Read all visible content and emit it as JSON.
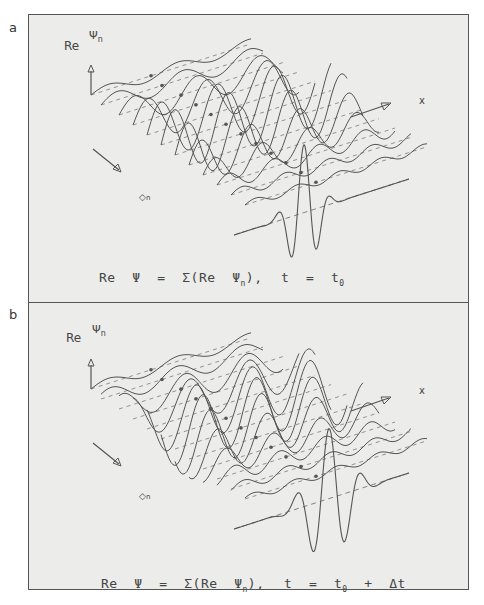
{
  "figure": {
    "panels": [
      {
        "id": "a",
        "label": "a",
        "y_axis_label": "Re",
        "y_axis_symbol": "Ψ",
        "y_axis_sub": "n",
        "n_axis_symbol": "n",
        "x_axis_symbol": "x",
        "equation_lhs": "Re  Ψ  =  Σ(Re  Ψ",
        "equation_sub": "n",
        "equation_close": "),",
        "time_text": "t  =  t",
        "time_sub": "0",
        "time_extra": "",
        "packet_shift": 0.0
      },
      {
        "id": "b",
        "label": "b",
        "y_axis_label": "Re",
        "y_axis_symbol": "Ψ",
        "y_axis_sub": "n",
        "n_axis_symbol": "n",
        "x_axis_symbol": "x",
        "equation_lhs": "Re  Ψ  =  Σ(Re  Ψ",
        "equation_sub": "n",
        "equation_close": "),",
        "time_text": "t  =  t",
        "time_sub": "0",
        "time_extra": "  +  Δt",
        "packet_shift": 1.0
      }
    ],
    "colors": {
      "frame_bg": "#ececea",
      "line": "#555555",
      "text": "#444444"
    },
    "wave_stack": {
      "count": 12,
      "description": "Partial waves Re Ψn stacked along n axis; sum shown as foremost curve (wave packet)"
    }
  }
}
